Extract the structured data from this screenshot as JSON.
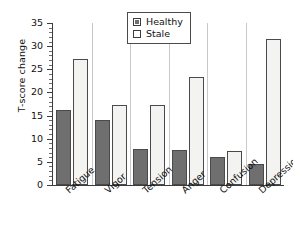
{
  "chart_data": {
    "type": "bar",
    "title": "",
    "xlabel": "",
    "ylabel": "T-score change",
    "ylim": [
      0,
      35
    ],
    "ytick_step": 5,
    "yticks": [
      0,
      5,
      10,
      15,
      20,
      25,
      30,
      35
    ],
    "ytick_labels": [
      "0",
      "5",
      "10",
      "15",
      "20",
      "25",
      "30",
      "35"
    ],
    "minor_tick_step": 1,
    "grid": false,
    "legend_position": "top-center",
    "categories": [
      "Fatigue",
      "Vigor",
      "Tension",
      "Anger",
      "Confusion",
      "Depression"
    ],
    "series": [
      {
        "name": "Healthy",
        "color": "#6f6f6f",
        "values": [
          16.2,
          14.1,
          7.8,
          7.5,
          6.1,
          4.5
        ]
      },
      {
        "name": "Stale",
        "color": "#f3f3f1",
        "values": [
          27.3,
          17.3,
          17.2,
          23.3,
          7.3,
          31.5
        ]
      }
    ]
  },
  "legend": {
    "entries": [
      {
        "label": "Healthy",
        "swatch": "filled-gray-square"
      },
      {
        "label": "Stale",
        "swatch": "empty-white-square"
      }
    ]
  },
  "colors": {
    "healthy_fill": "#6f6f6f",
    "stale_fill": "#f3f3f1",
    "bar_outline": "#4a4a4a",
    "axis": "#3c3c3c",
    "text": "#111111",
    "background": "#ffffff"
  }
}
